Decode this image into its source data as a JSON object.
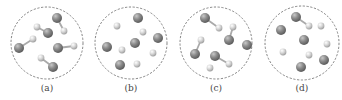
{
  "figure": {
    "width": 342,
    "height": 100,
    "colors": {
      "background": "#ffffff",
      "boundary": "#777777",
      "large_atom": "#8c8c8c",
      "large_atom_highlight": "#c8c8c8",
      "large_atom_shadow": "#555555",
      "small_atom": "#d4d4d4",
      "small_atom_highlight": "#ffffff",
      "small_atom_shadow": "#9a9a9a",
      "bond": "#aaaaaa",
      "label": "#444444"
    },
    "radii": {
      "large": 5,
      "small": 3.4
    },
    "panels": [
      {
        "id": "a",
        "label": "(a)",
        "circle": {
          "cx": 47,
          "cy": 43,
          "r": 36
        },
        "label_pos": {
          "x": 47,
          "y": 91
        },
        "atoms": [
          {
            "type": "large",
            "x": 57,
            "y": 18
          },
          {
            "type": "small",
            "x": 64,
            "y": 31
          },
          {
            "type": "small",
            "x": 37,
            "y": 27
          },
          {
            "type": "large",
            "x": 48,
            "y": 33
          },
          {
            "type": "small",
            "x": 33,
            "y": 39
          },
          {
            "type": "large",
            "x": 19,
            "y": 48
          },
          {
            "type": "large",
            "x": 58,
            "y": 48
          },
          {
            "type": "small",
            "x": 74,
            "y": 46
          },
          {
            "type": "small",
            "x": 41,
            "y": 58
          },
          {
            "type": "large",
            "x": 53,
            "y": 67
          }
        ],
        "bonds": [
          [
            0,
            1
          ],
          [
            2,
            3
          ],
          [
            4,
            5
          ],
          [
            6,
            7
          ],
          [
            8,
            9
          ]
        ]
      },
      {
        "id": "b",
        "label": "(b)",
        "circle": {
          "cx": 131,
          "cy": 43,
          "r": 36
        },
        "label_pos": {
          "x": 131,
          "y": 91
        },
        "atoms": [
          {
            "type": "large",
            "x": 138,
            "y": 18
          },
          {
            "type": "small",
            "x": 117,
            "y": 26
          },
          {
            "type": "small",
            "x": 143,
            "y": 32
          },
          {
            "type": "large",
            "x": 158,
            "y": 38
          },
          {
            "type": "large",
            "x": 135,
            "y": 43
          },
          {
            "type": "large",
            "x": 107,
            "y": 47
          },
          {
            "type": "small",
            "x": 122,
            "y": 50
          },
          {
            "type": "small",
            "x": 153,
            "y": 53
          },
          {
            "type": "large",
            "x": 120,
            "y": 65
          },
          {
            "type": "small",
            "x": 137,
            "y": 64
          }
        ],
        "bonds": []
      },
      {
        "id": "c",
        "label": "(c)",
        "circle": {
          "cx": 216,
          "cy": 43,
          "r": 36
        },
        "label_pos": {
          "x": 216,
          "y": 91
        },
        "atoms": [
          {
            "type": "large",
            "x": 205,
            "y": 18
          },
          {
            "type": "small",
            "x": 219,
            "y": 28
          },
          {
            "type": "small",
            "x": 233,
            "y": 27
          },
          {
            "type": "large",
            "x": 229,
            "y": 40
          },
          {
            "type": "large",
            "x": 247,
            "y": 45
          },
          {
            "type": "small",
            "x": 201,
            "y": 40
          },
          {
            "type": "large",
            "x": 195,
            "y": 54
          },
          {
            "type": "large",
            "x": 215,
            "y": 56
          },
          {
            "type": "small",
            "x": 229,
            "y": 64
          },
          {
            "type": "small",
            "x": 210,
            "y": 68
          }
        ],
        "bonds": [
          [
            0,
            1
          ],
          [
            2,
            3
          ],
          [
            5,
            6
          ],
          [
            7,
            8
          ]
        ]
      },
      {
        "id": "d",
        "label": "(d)",
        "circle": {
          "cx": 302,
          "cy": 43,
          "r": 37
        },
        "label_pos": {
          "x": 302,
          "y": 91
        },
        "atoms": [
          {
            "type": "large",
            "x": 296,
            "y": 17
          },
          {
            "type": "small",
            "x": 309,
            "y": 26
          },
          {
            "type": "small",
            "x": 321,
            "y": 26
          },
          {
            "type": "large",
            "x": 281,
            "y": 30
          },
          {
            "type": "large",
            "x": 304,
            "y": 40
          },
          {
            "type": "small",
            "x": 327,
            "y": 44
          },
          {
            "type": "small",
            "x": 283,
            "y": 52
          },
          {
            "type": "small",
            "x": 309,
            "y": 55
          },
          {
            "type": "large",
            "x": 324,
            "y": 60
          },
          {
            "type": "large",
            "x": 301,
            "y": 67
          }
        ],
        "bonds": [
          [
            0,
            1
          ]
        ]
      }
    ]
  }
}
